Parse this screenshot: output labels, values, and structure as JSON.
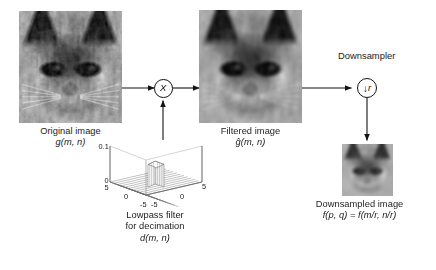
{
  "diagram": {
    "stage": {
      "width": 436,
      "height": 270,
      "background": "#ffffff"
    }
  },
  "blocks": {
    "original": {
      "caption_line1": "Original image",
      "caption_line2": "g(m, n)",
      "image_alt": "grayscale siamese cat face"
    },
    "filtered": {
      "caption_line1": "Filtered image",
      "caption_line2": "ĝ(m, n)",
      "image_alt": "grayscale siamese cat face blurred"
    },
    "downsampled": {
      "caption_line1": "Downsampled image",
      "caption_line2": "f(p, q) = f(m/r, n/r)",
      "image_alt": "small grayscale siamese cat face"
    },
    "filter": {
      "caption_line1": "Lowpass filter",
      "caption_line2": "for decimation",
      "caption_line3": "d(m, n)"
    }
  },
  "operators": {
    "multiplier": {
      "symbol": "X",
      "name": "multiply"
    },
    "downsampler": {
      "label": "Downsampler",
      "arrow": "↓",
      "rate": "r"
    }
  },
  "chart_data": {
    "type": "surface",
    "xlabel": "",
    "ylabel": "",
    "zlabel": "",
    "xticks": [
      -5,
      0,
      5
    ],
    "yticks": [
      -5,
      0,
      5
    ],
    "zticks": [
      0,
      0.1
    ],
    "ztick_labels": [
      "0",
      "0.1"
    ],
    "xtick_labels": [
      "-5",
      "0",
      "5"
    ],
    "ytick_labels": [
      "-5",
      "0",
      "5"
    ],
    "zlim": [
      0,
      0.1
    ],
    "xlim": [
      -5,
      5
    ],
    "ylim": [
      -5,
      5
    ],
    "grid": true,
    "legend": "none",
    "peak_value": 0.1,
    "floor_value": 0.0,
    "plateau_half_width": 1
  },
  "colors": {
    "line": "#141414",
    "text": "#1b1b1b",
    "background": "#ffffff",
    "mesh_line": "#4a4a4a",
    "mesh_face": "#f2f2f2"
  }
}
